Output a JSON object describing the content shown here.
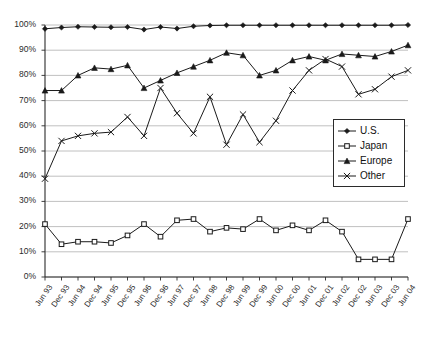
{
  "chart_data": {
    "type": "line",
    "title": "",
    "xlabel": "",
    "ylabel": "",
    "ylim": [
      0,
      100
    ],
    "ytick_step": 10,
    "ytick_labels": [
      "0%",
      "10%",
      "20%",
      "30%",
      "40%",
      "50%",
      "60%",
      "70%",
      "80%",
      "90%",
      "100%"
    ],
    "grid": true,
    "legend_position": "inside-right-middle",
    "categories": [
      "Jun 93",
      "Dec 93",
      "Jun 94",
      "Dec 94",
      "Jun 95",
      "Dec 95",
      "Jun 96",
      "Dec 96",
      "Jun 97",
      "Dec 97",
      "Jun 98",
      "Dec 98",
      "Jun 99",
      "Dec 99",
      "Jun 00",
      "Dec 00",
      "Jun 01",
      "Dec 01",
      "Jun 02",
      "Dec 02",
      "Jun 03",
      "Dec 03",
      "Jun 04"
    ],
    "series": [
      {
        "name": "U.S.",
        "marker": "diamond",
        "color": "#1a1a1a",
        "values": [
          98.5,
          99.0,
          99.3,
          99.2,
          99.1,
          99.2,
          98.2,
          99.2,
          98.6,
          99.5,
          99.8,
          99.9,
          99.9,
          99.9,
          99.9,
          99.9,
          99.9,
          99.9,
          99.9,
          99.9,
          99.9,
          99.9,
          100.0
        ]
      },
      {
        "name": "Japan",
        "marker": "square",
        "color": "#1a1a1a",
        "values": [
          21.0,
          13.0,
          14.0,
          14.0,
          13.5,
          16.5,
          21.0,
          16.0,
          22.5,
          23.0,
          18.0,
          19.5,
          19.0,
          23.0,
          18.5,
          20.5,
          18.5,
          22.5,
          18.0,
          7.0,
          7.0,
          7.0,
          23.0
        ]
      },
      {
        "name": "Europe",
        "marker": "triangle",
        "color": "#1a1a1a",
        "values": [
          74.0,
          74.0,
          80.0,
          83.0,
          82.5,
          84.0,
          75.0,
          78.0,
          81.0,
          83.5,
          86.0,
          89.0,
          88.0,
          80.0,
          82.0,
          86.0,
          87.5,
          86.0,
          88.5,
          88.0,
          87.5,
          89.5,
          92.0
        ]
      },
      {
        "name": "Other",
        "marker": "cross",
        "color": "#1a1a1a",
        "values": [
          39.0,
          54.0,
          56.0,
          57.0,
          57.5,
          63.5,
          56.0,
          75.0,
          65.0,
          57.0,
          71.5,
          52.5,
          64.5,
          53.5,
          62.0,
          74.0,
          82.0,
          86.5,
          83.5,
          72.5,
          74.5,
          79.5,
          82.0
        ]
      }
    ]
  },
  "legend": {
    "items": [
      {
        "label": "U.S.",
        "marker": "diamond"
      },
      {
        "label": "Japan",
        "marker": "square"
      },
      {
        "label": "Europe",
        "marker": "triangle"
      },
      {
        "label": "Other",
        "marker": "cross"
      }
    ]
  },
  "colors": {
    "line": "#1a1a1a",
    "grid": "#b0b0b0",
    "axis": "#2b2b2b",
    "background": "#ffffff",
    "text": "#2b2b2b"
  }
}
